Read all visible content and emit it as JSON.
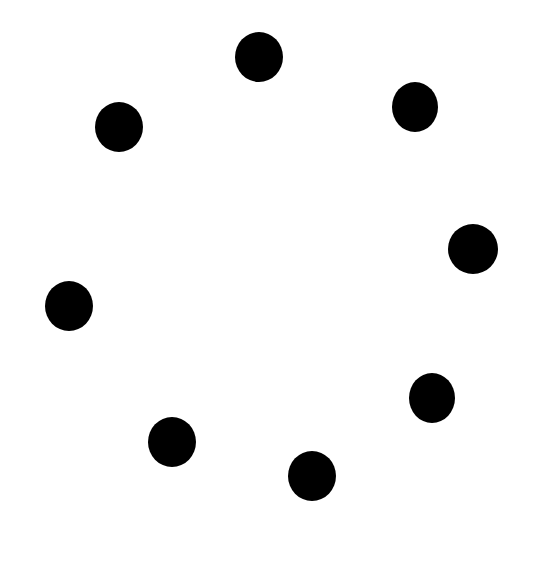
{
  "canvas": {
    "width": 540,
    "height": 581,
    "background": "#ffffff"
  },
  "spinner": {
    "dot_color": "#000000",
    "dot_count": 8,
    "dots": [
      {
        "cx": 259,
        "cy": 57,
        "w": 48,
        "h": 50
      },
      {
        "cx": 415,
        "cy": 107,
        "w": 46,
        "h": 50
      },
      {
        "cx": 119,
        "cy": 127,
        "w": 48,
        "h": 50
      },
      {
        "cx": 473,
        "cy": 249,
        "w": 50,
        "h": 50
      },
      {
        "cx": 69,
        "cy": 306,
        "w": 48,
        "h": 50
      },
      {
        "cx": 432,
        "cy": 398,
        "w": 46,
        "h": 50
      },
      {
        "cx": 172,
        "cy": 442,
        "w": 48,
        "h": 50
      },
      {
        "cx": 312,
        "cy": 476,
        "w": 48,
        "h": 50
      }
    ]
  }
}
